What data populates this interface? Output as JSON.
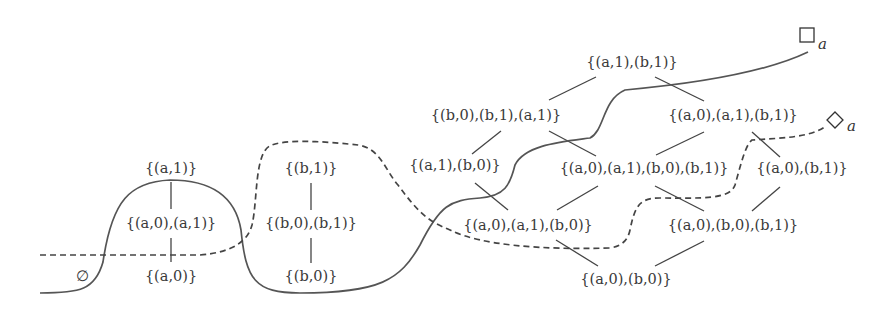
{
  "diagram": {
    "type": "lattice-diagram",
    "nodes": [
      {
        "id": "empty",
        "label": "∅",
        "x": 82,
        "y": 277
      },
      {
        "id": "a0",
        "label": "{(a,0)}",
        "x": 171,
        "y": 277
      },
      {
        "id": "a0a1",
        "label": "{(a,0),(a,1)}",
        "x": 171,
        "y": 224
      },
      {
        "id": "a1",
        "label": "{(a,1)}",
        "x": 171,
        "y": 169
      },
      {
        "id": "b0",
        "label": "{(b,0)}",
        "x": 311,
        "y": 277
      },
      {
        "id": "b0b1",
        "label": "{(b,0),(b,1)}",
        "x": 311,
        "y": 224
      },
      {
        "id": "b1",
        "label": "{(b,1)}",
        "x": 311,
        "y": 169
      },
      {
        "id": "a1b1",
        "label": "{(a,1),(b,1)}",
        "x": 632,
        "y": 63
      },
      {
        "id": "b0b1a1",
        "label": "{(b,0),(b,1),(a,1)}",
        "x": 496,
        "y": 116
      },
      {
        "id": "a0a1b1",
        "label": "{(a,0),(a,1),(b,1)}",
        "x": 733,
        "y": 116
      },
      {
        "id": "a1b0",
        "label": "{(a,1),(b,0)}",
        "x": 455,
        "y": 166
      },
      {
        "id": "a0a1b0b1",
        "label": "{(a,0),(a,1),(b,0),(b,1)}",
        "x": 644,
        "y": 169
      },
      {
        "id": "a0b1",
        "label": "{(a,0),(b,1)}",
        "x": 802,
        "y": 169
      },
      {
        "id": "a0a1b0",
        "label": "{(a,0),(a,1),(b,0)}",
        "x": 528,
        "y": 226
      },
      {
        "id": "a0b0b1",
        "label": "{(a,0),(b,0),(b,1)}",
        "x": 733,
        "y": 226
      },
      {
        "id": "a0b0",
        "label": "{(a,0),(b,0)}",
        "x": 626,
        "y": 280
      }
    ],
    "edges": [
      {
        "from": "a1",
        "to": "a0a1"
      },
      {
        "from": "a0a1",
        "to": "a0"
      },
      {
        "from": "b1",
        "to": "b0b1"
      },
      {
        "from": "b0b1",
        "to": "b0"
      },
      {
        "from": "a1b1",
        "to": "b0b1a1"
      },
      {
        "from": "a1b1",
        "to": "a0a1b1"
      },
      {
        "from": "b0b1a1",
        "to": "a1b0"
      },
      {
        "from": "b0b1a1",
        "to": "a0a1b0b1"
      },
      {
        "from": "a0a1b1",
        "to": "a0a1b0b1"
      },
      {
        "from": "a0a1b1",
        "to": "a0b1"
      },
      {
        "from": "a1b0",
        "to": "a0a1b0"
      },
      {
        "from": "a0a1b0b1",
        "to": "a0a1b0"
      },
      {
        "from": "a0a1b0b1",
        "to": "a0b0b1"
      },
      {
        "from": "a0b1",
        "to": "a0b0b1"
      },
      {
        "from": "a0a1b0",
        "to": "a0b0"
      },
      {
        "from": "a0b0b1",
        "to": "a0b0"
      }
    ],
    "curves": [
      {
        "id": "box-curve",
        "style": "solid",
        "label_symbol": "□",
        "label_subscript": "a",
        "label_x": 800,
        "label_y": 38
      },
      {
        "id": "diamond-curve",
        "style": "dashed",
        "label_symbol": "◇",
        "label_subscript": "a",
        "label_x": 835,
        "label_y": 120
      }
    ],
    "colors": {
      "background": "#ffffff",
      "ink": "#3a3a3a"
    }
  }
}
